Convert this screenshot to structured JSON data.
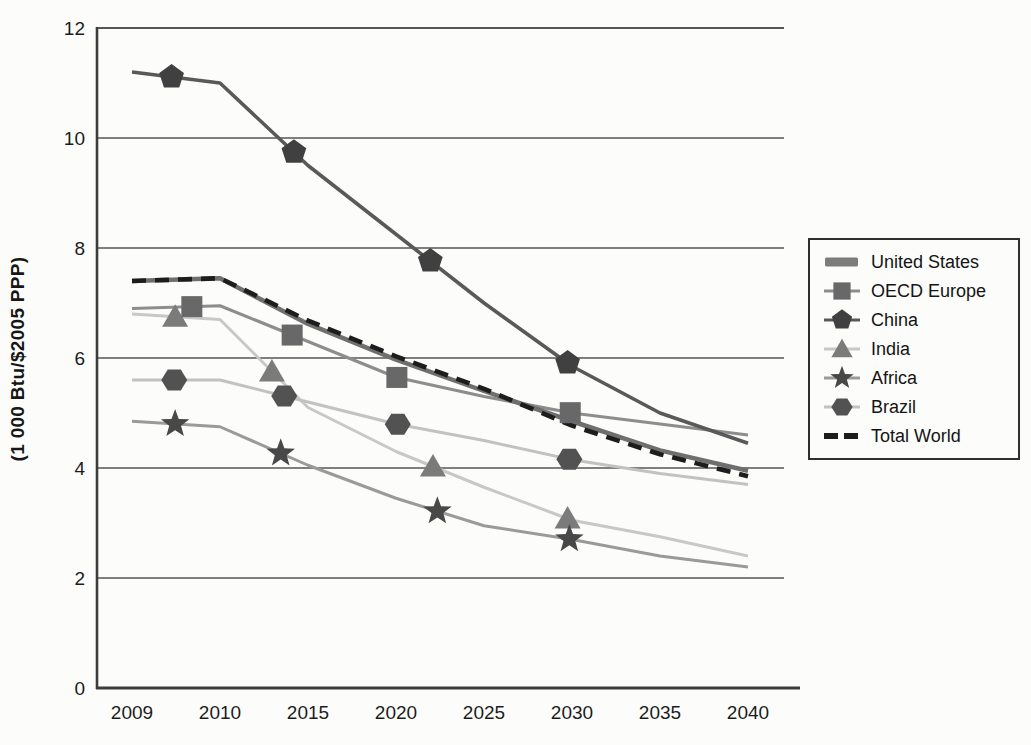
{
  "page": {
    "background": "#fcfcfb"
  },
  "chart_data": {
    "type": "line",
    "title": "",
    "xlabel": "",
    "ylabel": "(1 000 Btu/$2005 PPP)",
    "categories": [
      "2009",
      "2010",
      "2015",
      "2020",
      "2025",
      "2030",
      "2035",
      "2040"
    ],
    "yticks": [
      0,
      2,
      4,
      6,
      8,
      10,
      12
    ],
    "ylim": [
      0,
      12
    ],
    "grid": "horizontal",
    "legend_position": "right",
    "axis_color": "#3c3c3c",
    "grid_color": "#565656",
    "tick_label_color": "#1c1c1c",
    "series": [
      {
        "name": "United States",
        "values": [
          7.4,
          7.45,
          6.62,
          5.97,
          5.4,
          4.85,
          4.32,
          3.95
        ],
        "marker": "none",
        "line_color": "#6f6f6f",
        "marker_color": "#7c7c7c",
        "line_width": 4.5,
        "dash": "",
        "marker_at": []
      },
      {
        "name": "OECD Europe",
        "values": [
          6.9,
          6.95,
          6.3,
          5.65,
          5.3,
          5.0,
          4.8,
          4.6
        ],
        "marker": "square",
        "line_color": "#8d8d8d",
        "marker_color": "#686868",
        "line_width": 3.2,
        "dash": "",
        "marker_at": [
          0.68,
          1.82,
          3.01,
          4.98
        ]
      },
      {
        "name": "China",
        "values": [
          11.2,
          11.0,
          9.5,
          8.25,
          7.0,
          5.85,
          5.0,
          4.45
        ],
        "marker": "pentagon",
        "line_color": "#595959",
        "marker_color": "#404040",
        "line_width": 3.6,
        "dash": "",
        "marker_at": [
          0.45,
          1.84,
          3.39,
          4.95
        ]
      },
      {
        "name": "India",
        "values": [
          6.8,
          6.7,
          5.1,
          4.3,
          3.65,
          3.05,
          2.75,
          2.4
        ],
        "marker": "triangle",
        "line_color": "#c8c8c8",
        "marker_color": "#7b7b7b",
        "line_width": 3.0,
        "dash": "",
        "marker_at": [
          0.49,
          1.59,
          3.42,
          4.95
        ]
      },
      {
        "name": "Africa",
        "values": [
          4.85,
          4.75,
          4.05,
          3.45,
          2.95,
          2.7,
          2.4,
          2.2
        ],
        "marker": "star",
        "line_color": "#9a9a9a",
        "marker_color": "#484848",
        "line_width": 3.0,
        "dash": "",
        "marker_at": [
          0.49,
          1.69,
          3.47,
          4.97
        ]
      },
      {
        "name": "Brazil",
        "values": [
          5.6,
          5.6,
          5.2,
          4.8,
          4.5,
          4.15,
          3.9,
          3.7
        ],
        "marker": "hexagon",
        "line_color": "#c2c2c2",
        "marker_color": "#525252",
        "line_width": 3.0,
        "dash": "",
        "marker_at": [
          0.48,
          1.73,
          3.02,
          4.97
        ]
      },
      {
        "name": "Total World",
        "values": [
          7.4,
          7.45,
          6.68,
          6.03,
          5.44,
          4.77,
          4.25,
          3.85
        ],
        "marker": "none",
        "line_color": "#1d1d1d",
        "marker_color": "#1d1d1d",
        "line_width": 4.6,
        "dash": "14 9",
        "marker_at": []
      }
    ]
  }
}
